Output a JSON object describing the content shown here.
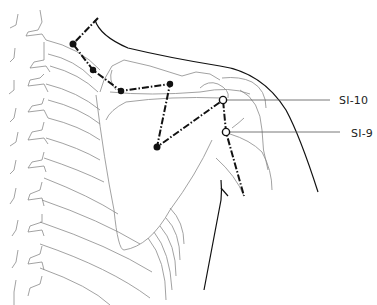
{
  "figure": {
    "line_color": "#111111",
    "anatomy_line_color": "#8a8a8a",
    "points": [
      {
        "id": "SI-10",
        "label": "SI-10",
        "marker": "hollow-circle",
        "x": 223,
        "y": 100,
        "leader_to_x": 330
      },
      {
        "id": "SI-9",
        "label": "SI-9",
        "marker": "hollow-circle",
        "x": 226,
        "y": 132,
        "leader_to_x": 340
      }
    ],
    "meridian_nodes": [
      {
        "x": 73,
        "y": 44
      },
      {
        "x": 93,
        "y": 70
      },
      {
        "x": 121,
        "y": 91
      },
      {
        "x": 170,
        "y": 84
      },
      {
        "x": 157,
        "y": 147
      }
    ]
  },
  "labels": {
    "si10": "SI-10",
    "si9": "SI-9"
  }
}
